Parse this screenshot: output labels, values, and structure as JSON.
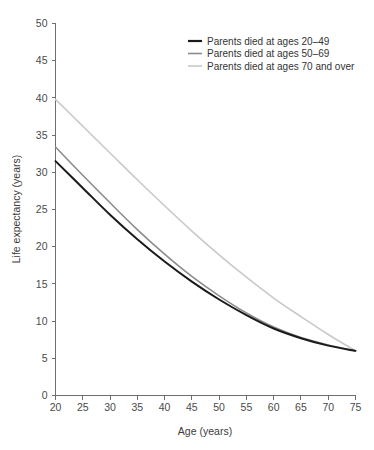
{
  "chart_data": {
    "type": "line",
    "title": "",
    "xlabel": "Age (years)",
    "ylabel": "Life expectancy (years)",
    "xlim": [
      20,
      75
    ],
    "ylim": [
      0,
      50
    ],
    "xticks": [
      20,
      25,
      30,
      35,
      40,
      45,
      50,
      55,
      60,
      65,
      70,
      75
    ],
    "yticks": [
      0,
      5,
      10,
      15,
      20,
      25,
      30,
      35,
      40,
      45,
      50
    ],
    "grid": false,
    "legend_position": "top-right",
    "x": [
      20,
      25,
      30,
      35,
      40,
      45,
      50,
      55,
      60,
      65,
      70,
      75
    ],
    "series": [
      {
        "name": "Parents died at ages 20–49",
        "color": "#1a1a1a",
        "width": 2.0,
        "values": [
          31.5,
          27.9,
          24.3,
          21.0,
          18.0,
          15.3,
          12.9,
          10.8,
          9.0,
          7.7,
          6.7,
          6.0
        ]
      },
      {
        "name": "Parents died at ages 50–69",
        "color": "#8c8c8c",
        "width": 1.6,
        "values": [
          33.4,
          29.6,
          25.9,
          22.3,
          19.0,
          16.0,
          13.4,
          11.1,
          9.2,
          7.8,
          6.8,
          6.0
        ]
      },
      {
        "name": "Parents died at ages 70 and over",
        "color": "#c9c9c9",
        "width": 1.6,
        "values": [
          39.8,
          36.2,
          32.6,
          29.0,
          25.5,
          22.1,
          18.9,
          15.9,
          13.1,
          10.6,
          8.2,
          6.0
        ]
      }
    ]
  },
  "legend": {
    "items": [
      {
        "label": "Parents died at ages 20–49"
      },
      {
        "label": "Parents died at ages 50–69"
      },
      {
        "label": "Parents died at ages 70 and over"
      }
    ]
  },
  "axes": {
    "x_title": "Age (years)",
    "y_title": "Life expectancy (years)",
    "x_tick_labels": [
      "20",
      "25",
      "30",
      "35",
      "40",
      "45",
      "50",
      "55",
      "60",
      "65",
      "70",
      "75"
    ],
    "y_tick_labels": [
      "0",
      "5",
      "10",
      "15",
      "20",
      "25",
      "30",
      "35",
      "40",
      "45",
      "50"
    ]
  },
  "colors": {
    "series_1": "#1a1a1a",
    "series_2": "#8c8c8c",
    "series_3": "#c9c9c9",
    "axis": "#6e6e6e",
    "text": "#3a3a3a",
    "background": "#ffffff"
  }
}
